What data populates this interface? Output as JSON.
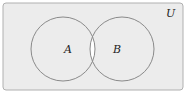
{
  "diagram": {
    "type": "venn",
    "universe_label": "U",
    "sets": [
      {
        "label": "A"
      },
      {
        "label": "B"
      }
    ],
    "shaded_region": "A ∩ B (unshaded/white); rest of U shaded gray",
    "colors": {
      "shade": "#ececec",
      "highlight": "#ffffff",
      "stroke": "#8a8a8a",
      "border": "#b0b0b0"
    }
  }
}
